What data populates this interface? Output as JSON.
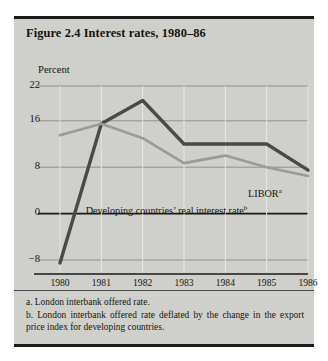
{
  "figure": {
    "title": "Figure 2.4 Interest rates, 1980–86"
  },
  "notes": {
    "a": "a. London interbank offered rate.",
    "b": "b. London interbank offered rate deflated by the change in the export price index for developing countries."
  },
  "annotations": {
    "libor": "LIBOR",
    "libor_sup": "a",
    "real_rate": "Developing countries’ real interest rate",
    "real_rate_sup": "b"
  },
  "colors": {
    "panel": "#cfcfcb",
    "series_real_rate": "#4a4a48",
    "series_libor": "#9a9a96",
    "grid": "#8a8a86",
    "axis": "#1a1a1a"
  },
  "chart_data": {
    "type": "line",
    "title": "Figure 2.4 Interest rates, 1980–86",
    "xlabel": "",
    "ylabel": "Percent",
    "ylim": [
      -8,
      22
    ],
    "yticks": [
      22,
      16,
      8,
      0,
      -8
    ],
    "ytick_labels": [
      "22",
      "16",
      "8",
      "0",
      "−8"
    ],
    "x": [
      1980,
      1981,
      1982,
      1983,
      1984,
      1985,
      1986
    ],
    "xtick_labels": [
      "1980",
      "1981",
      "1982",
      "1983",
      "1984",
      "1985",
      "1986"
    ],
    "grid": true,
    "legend": "in-plot labels",
    "series": [
      {
        "name": "Developing countries’ real interest rate",
        "values": [
          -8.5,
          15.5,
          19.5,
          12.0,
          12.0,
          12.0,
          7.5
        ],
        "color": "#4a4a48",
        "width": 3.4
      },
      {
        "name": "LIBOR",
        "values": [
          13.5,
          15.5,
          13.0,
          8.7,
          10.0,
          8.0,
          6.5
        ],
        "color": "#9a9a96",
        "width": 2.6
      }
    ]
  }
}
